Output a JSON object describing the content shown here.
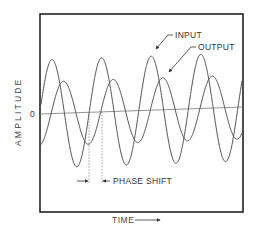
{
  "diagram": {
    "frame": {
      "x1": 40,
      "y1": 14,
      "x2": 243,
      "y2": 212,
      "color": "#222222"
    },
    "zero_line": {
      "x1": 40,
      "y1": 114,
      "x2": 243,
      "y2": 107,
      "label": "0",
      "color": "#666666"
    },
    "axes": {
      "y_label": "AMPLITUDE",
      "x_label": "TIME",
      "x_arrow": "time-arrow"
    },
    "series": [
      {
        "name": "INPUT",
        "amplitude": 54,
        "period": 49.6,
        "first_peak_x": 52,
        "color": "#555555"
      },
      {
        "name": "OUTPUT",
        "amplitude": 32,
        "period": 49.6,
        "first_peak_x": 63.5,
        "color": "#555555"
      }
    ],
    "annotations": {
      "input_label": "INPUT",
      "output_label": "OUTPUT",
      "phase_shift_label": "PHASE SHIFT",
      "phase_shift_x": [
        89,
        102
      ]
    }
  }
}
